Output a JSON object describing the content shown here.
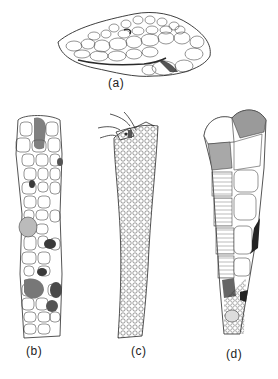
{
  "figure": {
    "panels": [
      {
        "id": "a",
        "label": "(a)"
      },
      {
        "id": "b",
        "label": "(b)"
      },
      {
        "id": "c",
        "label": "(c)"
      },
      {
        "id": "d",
        "label": "(d)"
      }
    ]
  },
  "colors": {
    "ink": "#2a2a2a",
    "background": "#ffffff",
    "shade_dark": "#3a3a3a",
    "shade_mid": "#8a8a8a",
    "shade_light": "#c8c8c8"
  }
}
